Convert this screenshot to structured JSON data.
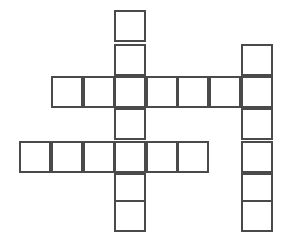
{
  "puzzle": {
    "title": "Crossword Grid",
    "kind": "blank-crossword-grid",
    "canvas": {
      "width": 288,
      "height": 243,
      "background": "#ffffff"
    },
    "style": {
      "line_color": "#4a4a4a",
      "line_width": 2,
      "cell_fill": "#ffffff",
      "cell_size": 32
    },
    "geometry": {
      "origin_x": 19,
      "origin_y": 10,
      "cell_size": 32,
      "column_count": 9,
      "row_count": 7,
      "column_x": [
        19,
        51,
        83,
        114,
        146,
        177,
        209,
        241,
        272
      ],
      "row_y": [
        10,
        44,
        76,
        108,
        141,
        173,
        200,
        232
      ]
    },
    "entries": [
      {
        "name": "center-down-word",
        "direction": "down",
        "start_col": 3,
        "start_row": 0,
        "length": 7,
        "letters": [
          "",
          "",
          "",
          "",
          "",
          "",
          ""
        ]
      },
      {
        "name": "right-down-word",
        "direction": "down",
        "start_col": 7,
        "start_row": 1,
        "length": 6,
        "letters": [
          "",
          "",
          "",
          "",
          "",
          ""
        ]
      },
      {
        "name": "upper-across-word",
        "direction": "across",
        "start_col": 1,
        "start_row": 2,
        "length": 7,
        "letters": [
          "",
          "",
          "",
          "",
          "",
          "",
          ""
        ]
      },
      {
        "name": "lower-across-word",
        "direction": "across",
        "start_col": 0,
        "start_row": 4,
        "length": 6,
        "letters": [
          "",
          "",
          "",
          "",
          "",
          ""
        ]
      }
    ],
    "cells": [
      {
        "name": "cell-c3-r0",
        "col": 3,
        "row": 0,
        "letter": ""
      },
      {
        "name": "cell-c3-r1",
        "col": 3,
        "row": 1,
        "letter": ""
      },
      {
        "name": "cell-c3-r2",
        "col": 3,
        "row": 2,
        "letter": ""
      },
      {
        "name": "cell-c3-r3",
        "col": 3,
        "row": 3,
        "letter": ""
      },
      {
        "name": "cell-c3-r4",
        "col": 3,
        "row": 4,
        "letter": ""
      },
      {
        "name": "cell-c3-r5",
        "col": 3,
        "row": 5,
        "letter": ""
      },
      {
        "name": "cell-c3-r6",
        "col": 3,
        "row": 6,
        "letter": ""
      },
      {
        "name": "cell-c7-r1",
        "col": 7,
        "row": 1,
        "letter": ""
      },
      {
        "name": "cell-c7-r2",
        "col": 7,
        "row": 2,
        "letter": ""
      },
      {
        "name": "cell-c7-r3",
        "col": 7,
        "row": 3,
        "letter": ""
      },
      {
        "name": "cell-c7-r4",
        "col": 7,
        "row": 4,
        "letter": ""
      },
      {
        "name": "cell-c7-r5",
        "col": 7,
        "row": 5,
        "letter": ""
      },
      {
        "name": "cell-c7-r6",
        "col": 7,
        "row": 6,
        "letter": ""
      },
      {
        "name": "cell-c1-r2",
        "col": 1,
        "row": 2,
        "letter": ""
      },
      {
        "name": "cell-c2-r2",
        "col": 2,
        "row": 2,
        "letter": ""
      },
      {
        "name": "cell-c4-r2",
        "col": 4,
        "row": 2,
        "letter": ""
      },
      {
        "name": "cell-c5-r2",
        "col": 5,
        "row": 2,
        "letter": ""
      },
      {
        "name": "cell-c6-r2",
        "col": 6,
        "row": 2,
        "letter": ""
      },
      {
        "name": "cell-c0-r4",
        "col": 0,
        "row": 4,
        "letter": ""
      },
      {
        "name": "cell-c1-r4",
        "col": 1,
        "row": 4,
        "letter": ""
      },
      {
        "name": "cell-c2-r4",
        "col": 2,
        "row": 4,
        "letter": ""
      },
      {
        "name": "cell-c4-r4",
        "col": 4,
        "row": 4,
        "letter": ""
      },
      {
        "name": "cell-c5-r4",
        "col": 5,
        "row": 4,
        "letter": ""
      }
    ]
  }
}
